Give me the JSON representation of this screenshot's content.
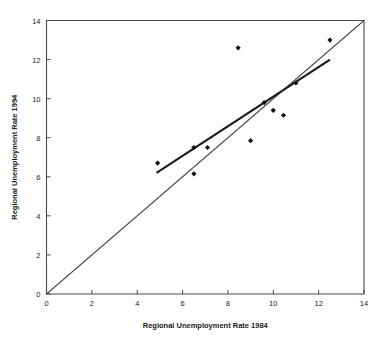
{
  "chart_data": {
    "type": "scatter",
    "title": "",
    "xlabel": "Regional Unemployment Rate 1984",
    "ylabel": "Regional Unemployment Rate 1994",
    "xlim": [
      0,
      14
    ],
    "ylim": [
      0,
      14
    ],
    "xticks": [
      0,
      2,
      4,
      6,
      8,
      10,
      12,
      14
    ],
    "yticks": [
      0,
      2,
      4,
      6,
      8,
      10,
      12,
      14
    ],
    "xtick_labels": [
      "0",
      "2",
      "4",
      "6",
      "8",
      "10",
      "12",
      "14"
    ],
    "ytick_labels": [
      "0",
      "2",
      "4",
      "6",
      "8",
      "10",
      "12",
      "14"
    ],
    "grid": false,
    "legend": "none",
    "marker": "diamond",
    "marker_color": "#111111",
    "points": [
      {
        "x": 4.9,
        "y": 6.7
      },
      {
        "x": 6.5,
        "y": 6.15
      },
      {
        "x": 6.5,
        "y": 7.5
      },
      {
        "x": 7.1,
        "y": 7.5
      },
      {
        "x": 8.45,
        "y": 12.6
      },
      {
        "x": 9.0,
        "y": 7.85
      },
      {
        "x": 9.6,
        "y": 9.8
      },
      {
        "x": 10.0,
        "y": 9.4
      },
      {
        "x": 10.45,
        "y": 9.15
      },
      {
        "x": 11.0,
        "y": 10.8
      },
      {
        "x": 12.5,
        "y": 13.0
      }
    ],
    "trend_line": {
      "name": "linear fit",
      "color": "#1a1a1a",
      "x0": 4.85,
      "y0": 6.2,
      "x1": 12.5,
      "y1": 12.0
    }
  }
}
